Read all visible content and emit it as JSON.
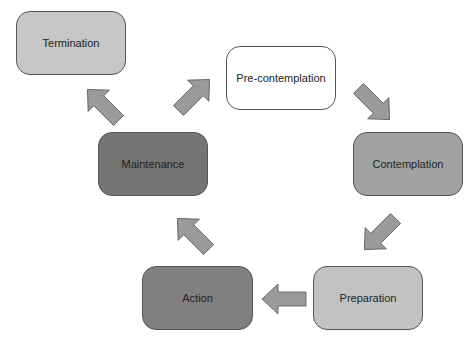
{
  "diagram": {
    "nodes": [
      {
        "id": "termination",
        "label": "Termination",
        "color": "#c6c6c6"
      },
      {
        "id": "precontemplation",
        "label": "Pre-contemplation",
        "color": "#ffffff"
      },
      {
        "id": "contemplation",
        "label": "Contemplation",
        "color": "#a2a2a2"
      },
      {
        "id": "preparation",
        "label": "Preparation",
        "color": "#c2c2c2"
      },
      {
        "id": "action",
        "label": "Action",
        "color": "#808080"
      },
      {
        "id": "maintenance",
        "label": "Maintenance",
        "color": "#747474"
      }
    ],
    "edges": [
      {
        "from": "precontemplation",
        "to": "contemplation"
      },
      {
        "from": "contemplation",
        "to": "preparation"
      },
      {
        "from": "preparation",
        "to": "action"
      },
      {
        "from": "action",
        "to": "maintenance"
      },
      {
        "from": "maintenance",
        "to": "precontemplation"
      },
      {
        "from": "maintenance",
        "to": "termination"
      }
    ],
    "arrow_color": "#9a9a9a"
  }
}
